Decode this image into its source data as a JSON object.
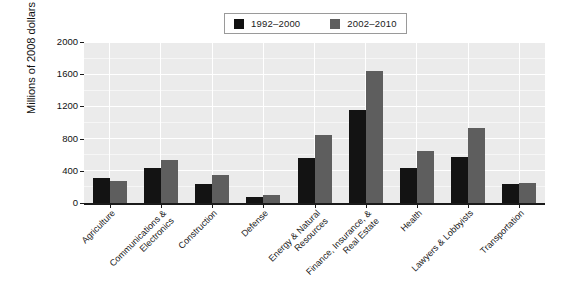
{
  "chart_data": {
    "type": "bar",
    "title": "",
    "subtitle": "",
    "xlabel": "",
    "ylabel": "Millions of 2008 dollars",
    "ylim": [
      0,
      2000
    ],
    "yticks": [
      0,
      400,
      800,
      1200,
      1600,
      2000
    ],
    "ytick_labels": [
      "0",
      "400",
      "800",
      "1200",
      "1600",
      "2000"
    ],
    "grid": true,
    "legend_position": "top-center",
    "categories": [
      "Agriculture",
      "Communications &\nElectronics",
      "Construction",
      "Defense",
      "Energy & Natural\nResources",
      "Finance, Insurance, &\nReal Estate",
      "Health",
      "Lawyers & Lobbyists",
      "Transportation"
    ],
    "series": [
      {
        "name": "1992–2000",
        "color": "#131313",
        "values": [
          310,
          430,
          240,
          70,
          560,
          1150,
          440,
          570,
          240
        ]
      },
      {
        "name": "2002–2010",
        "color": "#5e5e5e",
        "values": [
          275,
          540,
          345,
          95,
          850,
          1640,
          640,
          930,
          250
        ]
      }
    ]
  },
  "legend": {
    "entries": [
      {
        "label": "1992–2000",
        "swatch": "black-square-icon"
      },
      {
        "label": "2002–2010",
        "swatch": "gray-square-icon"
      }
    ]
  },
  "colors": {
    "series_1": "#131313",
    "series_2": "#5e5e5e",
    "plot_background": "#ebebeb",
    "gridline": "#ffffff",
    "axis": "#1a1a1a",
    "page_background": "#ffffff"
  }
}
